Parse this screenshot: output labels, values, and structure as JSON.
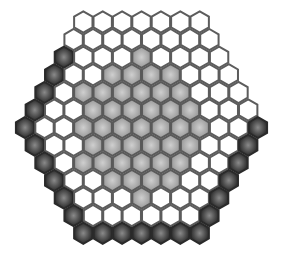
{
  "board": {
    "shape": "hexagon",
    "side_length": 7,
    "colors": {
      "W": {
        "fill": "#ffffff",
        "stroke": "#555555"
      },
      "G": {
        "fill": "#a8a8a8",
        "stroke": "#5a5a5a",
        "center": "#c4c4c4"
      },
      "D": {
        "fill": "#3a3a3a",
        "stroke": "#2a2a2a",
        "center": "#8a8a8a"
      }
    },
    "rows": [
      "WWWWWWW",
      "WWWWWWWW",
      "DWWWGWWWW",
      "DWWGGGGWWW",
      "DWGGGGGGWWW",
      "DWWGGGGGGWWW",
      "DWWGGGGGGGWWD",
      "DWWGGGGGGWWD",
      "DWGGGGGGWWD",
      "DWWGGGGWWD",
      "DWWWGWWWD",
      "DWWWWWWD",
      "DDDDDDD"
    ]
  }
}
